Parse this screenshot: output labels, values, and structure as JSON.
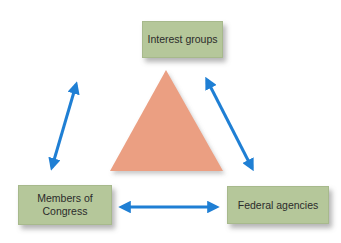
{
  "diagram": {
    "type": "iron-triangle",
    "nodes": [
      {
        "id": "interest",
        "label": "Interest groups"
      },
      {
        "id": "congress",
        "label_line1": "Members of",
        "label_line2": "Congress"
      },
      {
        "id": "agencies",
        "label": "Federal agencies"
      }
    ],
    "edges": [
      {
        "from": "interest",
        "to": "congress",
        "style": "double-arrow"
      },
      {
        "from": "interest",
        "to": "agencies",
        "style": "double-arrow"
      },
      {
        "from": "congress",
        "to": "agencies",
        "style": "double-arrow"
      }
    ],
    "colors": {
      "box_fill": "#b5c79a",
      "arrow": "#1f7fd4",
      "triangle": "#eb9f82",
      "text": "#2b2b2b"
    }
  }
}
